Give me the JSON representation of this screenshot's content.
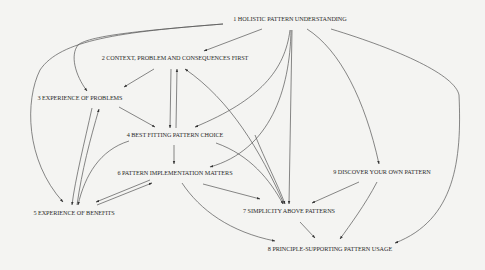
{
  "diagram": {
    "background": "#f4f4f2",
    "edge_color": "#555555",
    "text_color": "#2a2a2a",
    "nodes": [
      {
        "id": "n1",
        "label": "1 HOLISTIC PATTERN UNDERSTANDING",
        "x": 290,
        "y": 21
      },
      {
        "id": "n2",
        "label": "2 CONTEXT, PROBLEM AND CONSEQUENCES FIRST",
        "x": 175,
        "y": 60
      },
      {
        "id": "n3",
        "label": "3 EXPERIENCE OF PROBLEMS",
        "x": 80,
        "y": 100
      },
      {
        "id": "n4",
        "label": "4 BEST FITTING PATTERN CHOICE",
        "x": 175,
        "y": 137
      },
      {
        "id": "n5",
        "label": "5 EXPERIENCE OF BENEFITS",
        "x": 74,
        "y": 215
      },
      {
        "id": "n6",
        "label": "6 PATTERN IMPLEMENTATION MATTERS",
        "x": 175,
        "y": 175
      },
      {
        "id": "n7",
        "label": "7 SIMPLICITY ABOVE PATTERNS",
        "x": 289,
        "y": 213
      },
      {
        "id": "n8",
        "label": "8 PRINCIPLE-SUPPORTING PATTERN USAGE",
        "x": 330,
        "y": 251
      },
      {
        "id": "n9",
        "label": "9 DISCOVER YOUR OWN PATTERN",
        "x": 382,
        "y": 174
      }
    ],
    "edges": [
      {
        "from": "1",
        "to": "2"
      },
      {
        "from": "1",
        "to": "3"
      },
      {
        "from": "1",
        "to": "4"
      },
      {
        "from": "1",
        "to": "5"
      },
      {
        "from": "1",
        "to": "6"
      },
      {
        "from": "1",
        "to": "7"
      },
      {
        "from": "1",
        "to": "8"
      },
      {
        "from": "1",
        "to": "9"
      },
      {
        "from": "2",
        "to": "3"
      },
      {
        "from": "2",
        "to": "4"
      },
      {
        "from": "4",
        "to": "2"
      },
      {
        "from": "7",
        "to": "2"
      },
      {
        "from": "3",
        "to": "4"
      },
      {
        "from": "3",
        "to": "5"
      },
      {
        "from": "5",
        "to": "3"
      },
      {
        "from": "4",
        "to": "5"
      },
      {
        "from": "4",
        "to": "6"
      },
      {
        "from": "4",
        "to": "7"
      },
      {
        "from": "6",
        "to": "5"
      },
      {
        "from": "5",
        "to": "6"
      },
      {
        "from": "6",
        "to": "7"
      },
      {
        "from": "6",
        "to": "8"
      },
      {
        "from": "7",
        "to": "8"
      },
      {
        "from": "9",
        "to": "7"
      },
      {
        "from": "9",
        "to": "8"
      }
    ]
  }
}
